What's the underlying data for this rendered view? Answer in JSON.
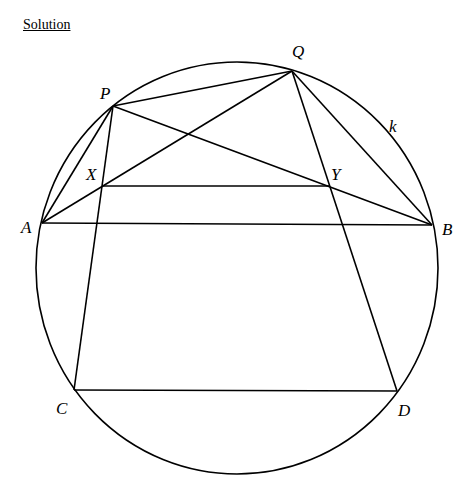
{
  "heading": "Solution",
  "diagram": {
    "circle": {
      "label": "k",
      "cx": 237,
      "cy": 268,
      "rx": 201,
      "ry": 206,
      "label_pos": [
        389,
        132
      ]
    },
    "points": {
      "P": {
        "x": 113,
        "y": 106,
        "label": "P",
        "lx": 100,
        "ly": 99
      },
      "Q": {
        "x": 292,
        "y": 71,
        "label": "Q",
        "lx": 292,
        "ly": 57
      },
      "X": {
        "x": 103,
        "y": 186,
        "label": "X",
        "lx": 86,
        "ly": 180
      },
      "Y": {
        "x": 330,
        "y": 186,
        "label": "Y",
        "lx": 331,
        "ly": 180
      },
      "A": {
        "x": 42,
        "y": 223,
        "label": "A",
        "lx": 21,
        "ly": 233
      },
      "B": {
        "x": 432,
        "y": 225,
        "label": "B",
        "lx": 442,
        "ly": 235
      },
      "C": {
        "x": 74,
        "y": 390,
        "label": "C",
        "lx": 56,
        "ly": 414
      },
      "D": {
        "x": 397,
        "y": 391,
        "label": "D",
        "lx": 398,
        "ly": 416
      }
    },
    "segments": [
      [
        "P",
        "Q"
      ],
      [
        "P",
        "A"
      ],
      [
        "P",
        "C"
      ],
      [
        "P",
        "B"
      ],
      [
        "Q",
        "A"
      ],
      [
        "Q",
        "B"
      ],
      [
        "Q",
        "D"
      ],
      [
        "X",
        "Y"
      ],
      [
        "A",
        "B"
      ],
      [
        "C",
        "D"
      ]
    ]
  }
}
